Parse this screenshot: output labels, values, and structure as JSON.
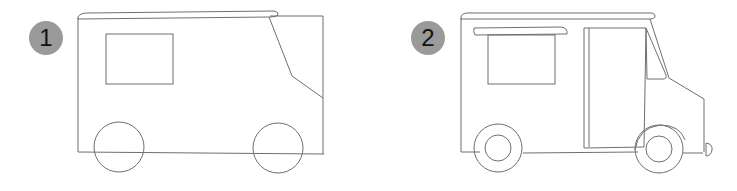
{
  "steps": [
    {
      "number": "1",
      "title": ""
    },
    {
      "number": "2",
      "title": ""
    }
  ],
  "colors": {
    "badge": "#9a9a9a",
    "line": "#6f6f6f",
    "background": "#ffffff"
  }
}
